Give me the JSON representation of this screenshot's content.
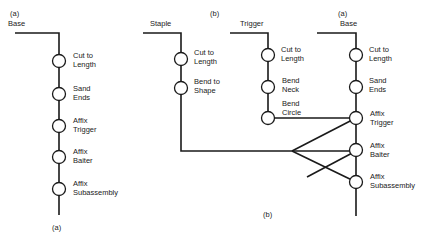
{
  "diagram": {
    "part_a": {
      "label_top": "(a)",
      "label_bottom": "(a)",
      "component": "Base",
      "operations": [
        [
          "Cut to",
          "Length"
        ],
        [
          "Sand",
          "Ends"
        ],
        [
          "Affix",
          "Trigger"
        ],
        [
          "Affix",
          "Baiter"
        ],
        [
          "Affix",
          "Subassembly"
        ]
      ]
    },
    "part_b": {
      "label_top": "(b)",
      "label_bottom": "(b)",
      "base_label_top": "(a)",
      "staple": {
        "component": "Staple",
        "operations": [
          [
            "Cut to",
            "Length"
          ],
          [
            "Bend to",
            "Shape"
          ]
        ]
      },
      "trigger": {
        "component": "Trigger",
        "operations": [
          [
            "Cut to",
            "Length"
          ],
          [
            "Bend",
            "Neck"
          ],
          [
            "Bend",
            "Circle"
          ]
        ]
      },
      "base": {
        "component": "Base",
        "operations": [
          [
            "Cut to",
            "Length"
          ],
          [
            "Sand",
            "Ends"
          ],
          [
            "Affix",
            "Trigger"
          ],
          [
            "Affix",
            "Baiter"
          ],
          [
            "Affix",
            "Subassembly"
          ]
        ]
      }
    },
    "colors": {
      "line": "#1a1a1a",
      "background": "#ffffff"
    }
  }
}
